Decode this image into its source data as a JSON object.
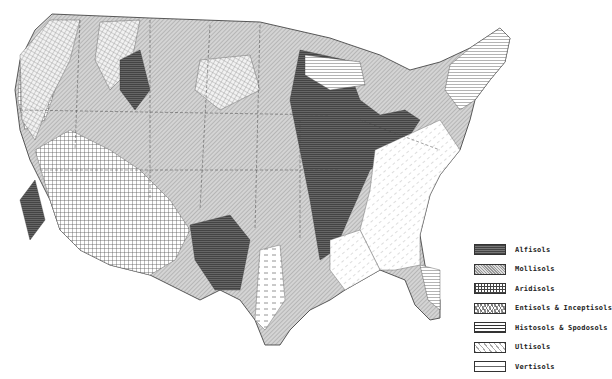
{
  "map": {
    "subject": "Soil orders of the contiguous United States",
    "legend": {
      "position": "bottom-right",
      "items": [
        {
          "label": "Alfisols",
          "pattern": "dense dark crosshatch",
          "color": "#555555"
        },
        {
          "label": "Mollisols",
          "pattern": "light diagonal stipple",
          "color": "#bbbbbb"
        },
        {
          "label": "Aridisols",
          "pattern": "square grid",
          "color": "#ffffff"
        },
        {
          "label": "Entisols & Inceptisols",
          "pattern": "diagonal crosshatch",
          "color": "#eeeeee"
        },
        {
          "label": "Histosols & Spodosols",
          "pattern": "horizontal lines",
          "color": "#ffffff"
        },
        {
          "label": "Ultisols",
          "pattern": "sparse diagonal dashes",
          "color": "#ffffff"
        },
        {
          "label": "Vertisols",
          "pattern": "horizontal dashed lines",
          "color": "#ffffff"
        }
      ]
    }
  }
}
